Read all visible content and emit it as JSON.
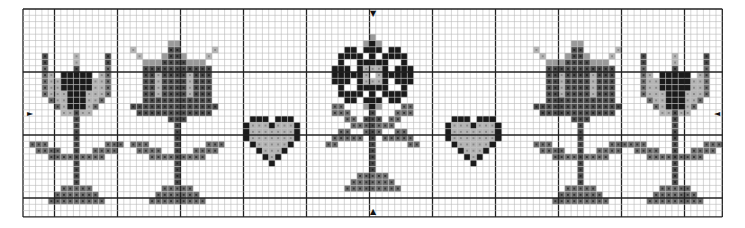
{
  "grid": {
    "origin_x": 23,
    "origin_y": 9,
    "cell": 6.3,
    "cols": 111,
    "rows": 33,
    "major_every": 10,
    "major_offset_x": 0,
    "major_offset_y": 0,
    "minor_color": "#b8b8b8",
    "major_color": "#222222",
    "border_color": "#222222"
  },
  "colors": {
    "black": "#1a1a1a",
    "dark": "#4a4a4a",
    "mid": "#6e6e6e",
    "light": "#b4b4b4",
    "outline": "#9a9a9a"
  },
  "center_markers": {
    "top": "▼",
    "bottom": "▲",
    "left": "►",
    "right": "◄"
  },
  "motifs": [
    {
      "name": "tulip-left",
      "type": "tulip",
      "col": 3
    },
    {
      "name": "bell-left",
      "type": "bell",
      "col": 17
    },
    {
      "name": "heart-left",
      "type": "heart",
      "col": 35
    },
    {
      "name": "star-flower-center",
      "type": "star",
      "col": 49
    },
    {
      "name": "heart-right",
      "type": "heart",
      "col": 67
    },
    {
      "name": "bell-right",
      "type": "bell",
      "col": 81
    },
    {
      "name": "tulip-right",
      "type": "tulip",
      "col": 98
    }
  ]
}
